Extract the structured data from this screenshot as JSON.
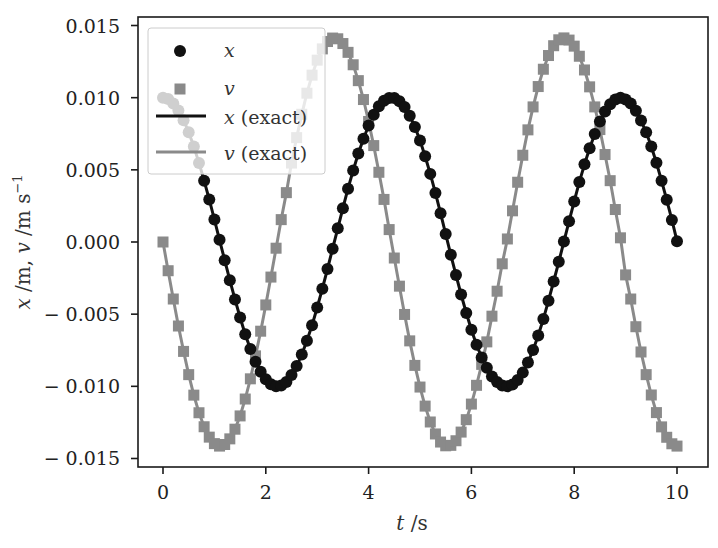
{
  "chart_data": {
    "type": "line",
    "title": "",
    "xlabel": "t /s",
    "ylabel": "x /m, v /m s^-1",
    "xlim": [
      -0.5,
      10.6
    ],
    "ylim": [
      -0.0156,
      0.0156
    ],
    "grid": false,
    "legend_position": "upper left",
    "x_ticks": [
      0,
      2,
      4,
      6,
      8,
      10
    ],
    "x_tick_labels": [
      "0",
      "2",
      "4",
      "6",
      "8",
      "10"
    ],
    "y_ticks": [
      0.015,
      0.01,
      0.005,
      0.0,
      -0.005,
      -0.01,
      -0.015
    ],
    "y_tick_labels": [
      "0.015",
      "0.010",
      "0.005",
      "0.000",
      "− 0.005",
      "− 0.010",
      "− 0.015"
    ],
    "t_start": 0,
    "t_step": 0.1,
    "series": [
      {
        "name": "x",
        "style": "markers",
        "marker": "circle",
        "color": "#111111",
        "values": [
          0.01,
          0.0099,
          0.0096,
          0.00911,
          0.00844,
          0.0076,
          0.00661,
          0.00548,
          0.00425,
          0.00294,
          0.00156,
          0.00015,
          -0.00126,
          -0.00265,
          -0.00398,
          -0.00523,
          -0.00639,
          -0.00742,
          -0.0083,
          -0.00899,
          -0.00951,
          -0.00985,
          -0.01,
          -0.00995,
          -0.0097,
          -0.00922,
          -0.00859,
          -0.0078,
          -0.00684,
          -0.00576,
          -0.00454,
          -0.00324,
          -0.00187,
          -0.00046,
          0.00095,
          0.00234,
          0.00369,
          0.00496,
          0.00613,
          0.00716,
          0.00807,
          0.00881,
          0.0094,
          0.00978,
          0.00997,
          0.00997,
          0.00976,
          0.00935,
          0.00875,
          0.00797,
          0.00704,
          0.00594,
          0.00472,
          0.0034,
          0.00199,
          0.00055,
          -0.00089,
          -0.00229,
          -0.00364,
          -0.00492,
          -0.00608,
          -0.00712,
          -0.008,
          -0.00872,
          -0.00932,
          -0.0097,
          -0.00994,
          -0.01,
          -0.00988,
          -0.00956,
          -0.00905,
          -0.00835,
          -0.00749,
          -0.00648,
          -0.00533,
          -0.00407,
          -0.00274,
          -0.00137,
          3e-05,
          0.00144,
          0.00281,
          0.00415,
          0.00538,
          0.0065,
          0.00749,
          0.00835,
          0.00904,
          0.00954,
          0.00987,
          0.01,
          0.00987,
          0.0096,
          0.0091,
          0.00842,
          0.0076,
          0.00662,
          0.00549,
          0.00424,
          0.00292,
          0.00153,
          6e-05
        ]
      },
      {
        "name": "v",
        "style": "markers",
        "marker": "square",
        "color": "#8a8a8a",
        "values": [
          0,
          -0.00199,
          -0.00395,
          -0.00582,
          -0.00758,
          -0.00919,
          -0.01061,
          -0.01183,
          -0.0128,
          -0.01352,
          -0.01397,
          -0.01414,
          -0.01403,
          -0.01364,
          -0.01297,
          -0.01205,
          -0.01088,
          -0.00948,
          -0.00789,
          -0.00618,
          -0.00436,
          -0.00243,
          -0.00043,
          0.00155,
          0.00342,
          0.00547,
          0.00723,
          0.00885,
          0.01031,
          0.01156,
          0.0126,
          0.01338,
          0.01389,
          0.01413,
          0.01408,
          0.01375,
          0.01314,
          0.01228,
          0.01118,
          0.00987,
          0.00835,
          0.00668,
          0.00483,
          0.00295,
          0.00086,
          -0.00111,
          -0.00306,
          -0.00502,
          -0.00685,
          -0.00855,
          -0.01005,
          -0.01137,
          -0.01247,
          -0.0133,
          -0.01386,
          -0.01412,
          -0.01409,
          -0.01377,
          -0.01317,
          -0.01231,
          -0.01123,
          -0.00993,
          -0.00848,
          -0.00692,
          -0.00514,
          -0.00341,
          -0.00151,
          0.00021,
          0.00216,
          0.00414,
          0.00601,
          0.00777,
          0.00936,
          0.01077,
          0.01197,
          0.01292,
          0.0136,
          0.01401,
          0.01414,
          0.01399,
          0.01357,
          0.01287,
          0.01192,
          0.01075,
          0.00936,
          0.00779,
          0.00606,
          0.00425,
          0.00225,
          0.00029,
          -0.00228,
          -0.00395,
          -0.00587,
          -0.00762,
          -0.00919,
          -0.0106,
          -0.01182,
          -0.01281,
          -0.01353,
          -0.01398,
          -0.01414
        ]
      },
      {
        "name": "x (exact)",
        "style": "line",
        "color": "#111111",
        "source": "x"
      },
      {
        "name": "v (exact)",
        "style": "line",
        "color": "#8a8a8a",
        "source": "v"
      }
    ],
    "legend": [
      {
        "symbol": "circle",
        "var": "x",
        "suffix": ""
      },
      {
        "symbol": "square",
        "var": "v",
        "suffix": ""
      },
      {
        "symbol": "line-dark",
        "var": "x",
        "suffix": " (exact)"
      },
      {
        "symbol": "line-gray",
        "var": "v",
        "suffix": " (exact)"
      }
    ]
  },
  "labels": {
    "xlabel_var": "t",
    "xlabel_unit": " /s",
    "ylabel_x": "x",
    "ylabel_x_unit": " /m, ",
    "ylabel_v": "v",
    "ylabel_v_unit": " /m s",
    "ylabel_exp": "−1"
  }
}
